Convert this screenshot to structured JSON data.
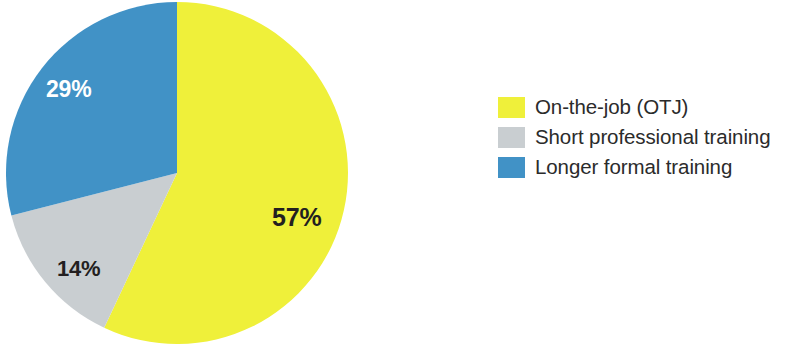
{
  "chart_data": {
    "type": "pie",
    "title": "",
    "subtitle": "",
    "xlabel": "",
    "ylabel": "",
    "grid": false,
    "legend_position": "right",
    "start_angle_deg": 0,
    "direction": "clockwise",
    "categories": [
      "On-the-job (OTJ)",
      "Short professional training",
      "Longer formal training"
    ],
    "values": [
      57,
      14,
      29
    ],
    "value_unit": "%",
    "data_labels": [
      "57%",
      "14%",
      "29%"
    ],
    "colors": [
      "#eff03a",
      "#c9ced1",
      "#4192c6"
    ],
    "label_text_colors": [
      "#231f20",
      "#231f20",
      "#ffffff"
    ],
    "slices": [
      {
        "name": "On-the-job (OTJ)",
        "value": 57,
        "label": "57%",
        "color": "#eff03a",
        "start_deg": 0,
        "sweep_deg": 205.2
      },
      {
        "name": "Short professional training",
        "value": 14,
        "label": "14%",
        "color": "#c9ced1",
        "start_deg": 205.2,
        "sweep_deg": 50.4
      },
      {
        "name": "Longer formal training",
        "value": 29,
        "label": "29%",
        "color": "#4192c6",
        "start_deg": 255.6,
        "sweep_deg": 104.4
      }
    ]
  },
  "pie": {
    "center_x": 177,
    "center_y": 173,
    "radius": 171,
    "labels": {
      "otj": "57%",
      "short": "14%",
      "longer": "29%"
    }
  },
  "legend": {
    "items": [
      {
        "label": "On-the-job (OTJ)",
        "color": "#eff03a"
      },
      {
        "label": "Short professional training",
        "color": "#c9ced1"
      },
      {
        "label": "Longer formal training",
        "color": "#4192c6"
      }
    ]
  }
}
